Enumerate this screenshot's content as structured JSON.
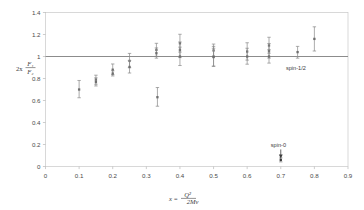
{
  "chart_data": {
    "type": "scatter",
    "title": "",
    "xlabel": "x = Q² / 2Mν",
    "xlabel_parts": {
      "lead": "x =",
      "numerator": "Q²",
      "denominator": "2Mν"
    },
    "ylabel": "2x F₁ / F₂",
    "ylabel_parts": {
      "lead": "2x",
      "numerator": "F₁",
      "denominator": "F₂"
    },
    "xlim": [
      0,
      0.9
    ],
    "ylim": [
      0,
      1.4
    ],
    "xticks": [
      0,
      0.1,
      0.2,
      0.3,
      0.4,
      0.5,
      0.6,
      0.7,
      0.8,
      0.9
    ],
    "xtick_labels": [
      "0",
      "0.1",
      "0.2",
      "0.3",
      "0.4",
      "0.5",
      "0.6",
      "0.7",
      "0.8",
      "0.9"
    ],
    "yticks": [
      0,
      0.2,
      0.4,
      0.6,
      0.8,
      1,
      1.2,
      1.4
    ],
    "ytick_labels": [
      "0",
      "0.2",
      "0.4",
      "0.6",
      "0.8",
      "1",
      "1.2",
      "1.4"
    ],
    "grid": false,
    "legend": "none",
    "reference_lines": [
      {
        "name": "spin-half-prediction",
        "y": 1.0,
        "label": "spin-1/2",
        "color": "#8c8c8c"
      }
    ],
    "annotations": [
      {
        "name": "spin-half-label",
        "text": "spin-1/2",
        "x": 0.745,
        "y": 0.875
      },
      {
        "name": "spin-zero-label",
        "text": "spin-0",
        "x": 0.693,
        "y": 0.175
      }
    ],
    "series": [
      {
        "name": "callan-gross-ratio-measurements",
        "marker": "point-with-error-bars",
        "color": "#6e6e6e",
        "points": [
          {
            "x": 0.1,
            "y": 0.7,
            "yerr_low": 0.075,
            "yerr_high": 0.082
          },
          {
            "x": 0.15,
            "y": 0.79,
            "yerr_low": 0.042,
            "yerr_high": 0.04
          },
          {
            "x": 0.15,
            "y": 0.77,
            "yerr_low": 0.038,
            "yerr_high": 0.036
          },
          {
            "x": 0.2,
            "y": 0.88,
            "yerr_low": 0.045,
            "yerr_high": 0.052
          },
          {
            "x": 0.2,
            "y": 0.845,
            "yerr_low": 0.022,
            "yerr_high": 0.025
          },
          {
            "x": 0.25,
            "y": 0.96,
            "yerr_low": 0.062,
            "yerr_high": 0.068
          },
          {
            "x": 0.25,
            "y": 0.905,
            "yerr_low": 0.055,
            "yerr_high": 0.058
          },
          {
            "x": 0.33,
            "y": 1.06,
            "yerr_low": 0.058,
            "yerr_high": 0.06
          },
          {
            "x": 0.33,
            "y": 1.03,
            "yerr_low": 0.045,
            "yerr_high": 0.048
          },
          {
            "x": 0.333,
            "y": 0.63,
            "yerr_low": 0.082,
            "yerr_high": 0.088
          },
          {
            "x": 0.4,
            "y": 1.12,
            "yerr_low": 0.08,
            "yerr_high": 0.082
          },
          {
            "x": 0.4,
            "y": 1.06,
            "yerr_low": 0.07,
            "yerr_high": 0.072
          },
          {
            "x": 0.4,
            "y": 1.0,
            "yerr_low": 0.082,
            "yerr_high": 0.085
          },
          {
            "x": 0.5,
            "y": 1.055,
            "yerr_low": 0.055,
            "yerr_high": 0.058
          },
          {
            "x": 0.5,
            "y": 1.0,
            "yerr_low": 0.09,
            "yerr_high": 0.092
          },
          {
            "x": 0.5,
            "y": 0.995,
            "yerr_low": 0.082,
            "yerr_high": 0.08
          },
          {
            "x": 0.6,
            "y": 1.045,
            "yerr_low": 0.078,
            "yerr_high": 0.08
          },
          {
            "x": 0.6,
            "y": 1.0,
            "yerr_low": 0.07,
            "yerr_high": 0.075
          },
          {
            "x": 0.665,
            "y": 1.1,
            "yerr_low": 0.07,
            "yerr_high": 0.075
          },
          {
            "x": 0.665,
            "y": 1.05,
            "yerr_low": 0.065,
            "yerr_high": 0.068
          },
          {
            "x": 0.665,
            "y": 1.0,
            "yerr_low": 0.06,
            "yerr_high": 0.062
          },
          {
            "x": 0.75,
            "y": 1.04,
            "yerr_low": 0.055,
            "yerr_high": 0.052
          },
          {
            "x": 0.8,
            "y": 1.16,
            "yerr_low": 0.11,
            "yerr_high": 0.11
          }
        ]
      },
      {
        "name": "spin-zero-prediction-point",
        "marker": "point-with-error-bars",
        "color": "#3a3a3a",
        "points": [
          {
            "x": 0.7,
            "y": 0.06,
            "yerr_low": 0.018,
            "yerr_high": 0.018
          }
        ]
      }
    ]
  }
}
